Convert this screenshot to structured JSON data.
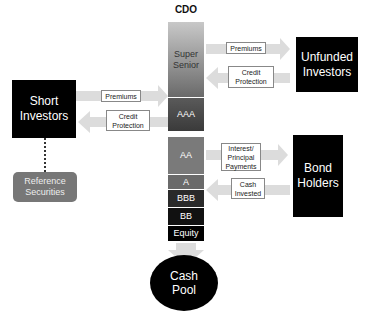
{
  "title": "CDO",
  "tranches": [
    {
      "label": "Super\nSenior",
      "top": 22,
      "height": 76,
      "color": "linear-gradient(#c8c8c8,#6a6a6a)",
      "text_color": "#333"
    },
    {
      "label": "AAA",
      "top": 98,
      "height": 34,
      "color": "linear-gradient(#5a5a5a,#3a3a3a)",
      "text_color": "#fff"
    },
    {
      "label": "AA",
      "top": 137,
      "height": 38,
      "color": "#7a7a7a",
      "text_color": "#fff"
    },
    {
      "label": "A",
      "top": 175,
      "height": 15,
      "color": "#6a6a6a",
      "text_color": "#fff"
    },
    {
      "label": "BBB",
      "top": 190,
      "height": 18,
      "color": "#2a2a2a",
      "text_color": "#fff"
    },
    {
      "label": "BB",
      "top": 208,
      "height": 18,
      "color": "#111111",
      "text_color": "#fff"
    },
    {
      "label": "Equity",
      "top": 226,
      "height": 16,
      "color": "#000000",
      "text_color": "#fff"
    }
  ],
  "entities": {
    "short_investors": "Short\nInvestors",
    "unfunded_investors": "Unfunded\nInvestors",
    "bond_holders": "Bond\nHolders",
    "reference_securities": "Reference\nSecurities",
    "cash_pool": "Cash\nPool"
  },
  "flows": {
    "short_premiums": "Premiums",
    "short_credit_protection": "Credit\nProtection",
    "unfunded_premiums": "Premiums",
    "unfunded_credit_protection": "Credit\nProtection",
    "bond_interest": "Interest/\nPrincipal\nPayments",
    "bond_cash_invested": "Cash\nInvested"
  },
  "colors": {
    "arrow": "#dcdcdc",
    "entity_box": "#000000",
    "reference_box": "#777777"
  }
}
